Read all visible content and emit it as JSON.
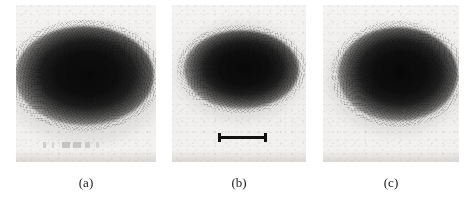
{
  "figure": {
    "type": "image-panel-figure",
    "panel_count": 3,
    "background_color": "#ffffff",
    "panel_background_color": "#f1efed",
    "blob_color": "#0a0a0a",
    "scalebar_color": "#111111",
    "caption_color": "#1b1b1b"
  },
  "panels": [
    {
      "id": "panel-a",
      "caption": "(a)",
      "frame": {
        "x": 16,
        "y": 5,
        "width": 140,
        "height": 157
      },
      "blob": {
        "name": "dark-diffuse-spot",
        "center_x_pct": 49,
        "center_y_pct": 45,
        "width_pct": 99,
        "height_pct": 63,
        "description": "wide dark ellipse, merges with left edge of panel"
      },
      "annotations": [
        {
          "name": "faint-smudge-marks",
          "x": 40,
          "y": 142,
          "width": 72,
          "height": 6
        }
      ],
      "scalebar": null
    },
    {
      "id": "panel-b",
      "caption": "(b)",
      "frame": {
        "x": 172,
        "y": 5,
        "width": 134,
        "height": 157
      },
      "blob": {
        "name": "dark-diffuse-spot",
        "center_x_pct": 52,
        "center_y_pct": 41,
        "width_pct": 86,
        "height_pct": 50,
        "description": "compact dark ellipse centred high in the panel"
      },
      "annotations": [],
      "scalebar": {
        "name": "scale-bar",
        "x": 218,
        "y": 133,
        "width": 49,
        "height": 9,
        "style": "I-beam with vertical end caps",
        "label": ""
      }
    },
    {
      "id": "panel-c",
      "caption": "(c)",
      "frame": {
        "x": 323,
        "y": 5,
        "width": 136,
        "height": 157
      },
      "blob": {
        "name": "dark-diffuse-spot",
        "center_x_pct": 55,
        "center_y_pct": 44,
        "width_pct": 88,
        "height_pct": 60,
        "description": "tall dark ellipse shifted toward the right of the panel"
      },
      "annotations": [],
      "scalebar": null
    }
  ],
  "captions": {
    "a": "(a)",
    "b": "(b)",
    "c": "(c)"
  }
}
